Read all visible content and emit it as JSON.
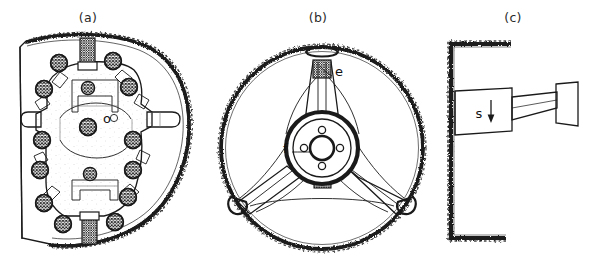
{
  "figure": {
    "background_color": "#ffffff",
    "ink_color": "#1a1a1a",
    "width": 592,
    "height": 265
  },
  "panels": [
    {
      "id": "a",
      "caption": "(a)",
      "caption_x": 88,
      "caption_y": 22,
      "description": "front view of bolted disc / end plate",
      "reference_labels": [
        {
          "key": "o",
          "text": "o",
          "x": 107,
          "y": 123
        }
      ]
    },
    {
      "id": "b",
      "caption": "(b)",
      "caption_x": 318,
      "caption_y": 22,
      "description": "three-spoke wheel with central hub",
      "reference_labels": [
        {
          "key": "e",
          "text": "e",
          "x": 335,
          "y": 76
        },
        {
          "key": "f",
          "text": "f",
          "x": 287,
          "y": 150
        }
      ]
    },
    {
      "id": "c",
      "caption": "(c)",
      "caption_x": 513,
      "caption_y": 22,
      "description": "side schematic: wall bracket with actuator block and shaft",
      "reference_labels": [
        {
          "key": "s",
          "text": "s",
          "x": 487,
          "y": 115
        }
      ]
    }
  ]
}
